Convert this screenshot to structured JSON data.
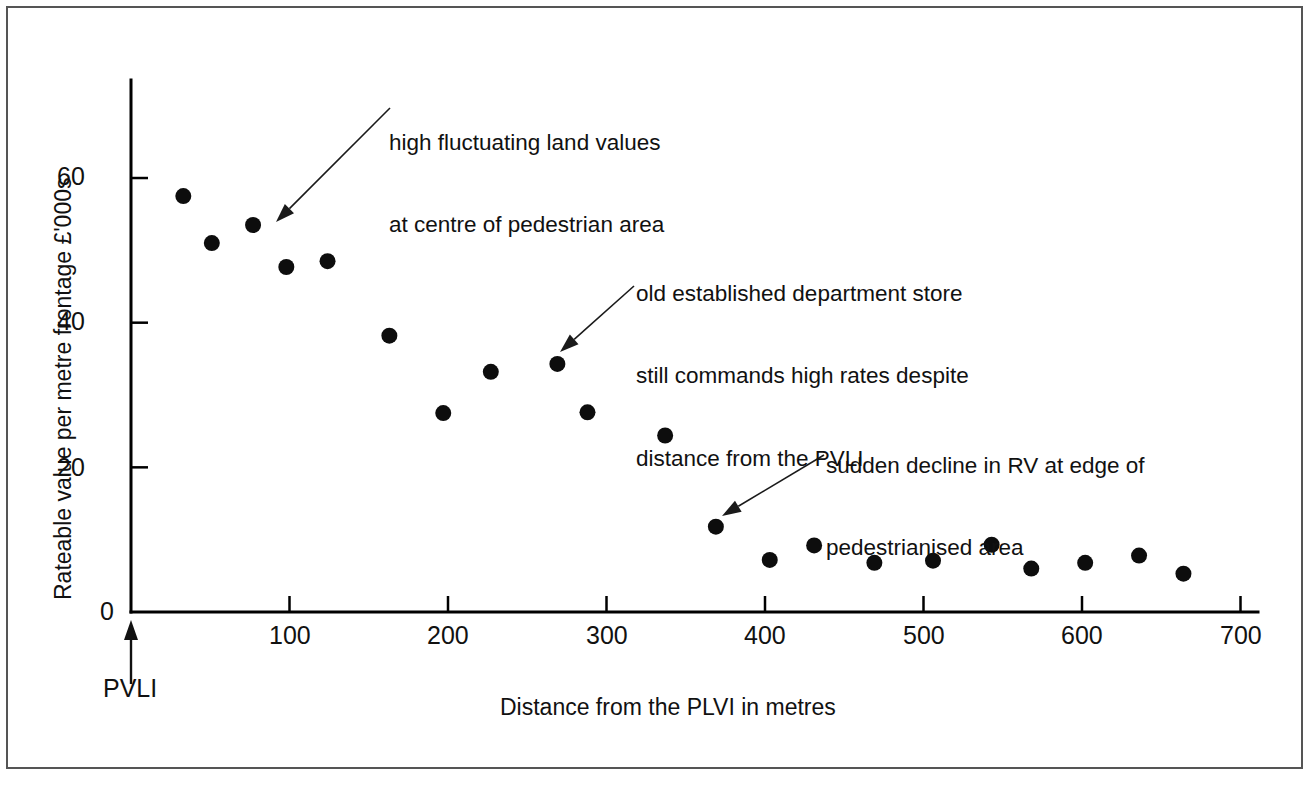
{
  "figure": {
    "background_color": "#ffffff",
    "border_color": "#555555",
    "ink_color": "#111111"
  },
  "axes": {
    "x_title": "Distance from the PLVI in metres",
    "y_title": "Rateable value per metre frontage £'000s",
    "origin_marker_label": "PVLI",
    "x_ticks": [
      "100",
      "200",
      "300",
      "400",
      "500",
      "600",
      "700"
    ],
    "y_ticks": [
      "0",
      "20",
      "40",
      "60"
    ]
  },
  "annotations": [
    {
      "name": "annotation-high-fluctuating",
      "lines": [
        "high fluctuating land values",
        "at centre of pedestrian area"
      ],
      "text_x": 389,
      "text_y": 74,
      "arrow_from_x": 390,
      "arrow_from_y": 108,
      "arrow_to_x": 276,
      "arrow_to_y": 222
    },
    {
      "name": "annotation-department-store",
      "lines": [
        "old established department store",
        "still commands high rates despite",
        "distance from the PVLI"
      ],
      "text_x": 636,
      "text_y": 225,
      "arrow_from_x": 634,
      "arrow_from_y": 286,
      "arrow_to_x": 560,
      "arrow_to_y": 352
    },
    {
      "name": "annotation-sudden-decline",
      "lines": [
        "sudden decline in RV at edge of",
        "pedestrianised area"
      ],
      "text_x": 826,
      "text_y": 397,
      "arrow_from_x": 824,
      "arrow_from_y": 455,
      "arrow_to_x": 722,
      "arrow_to_y": 516
    }
  ],
  "chart_data": {
    "type": "scatter",
    "title": "",
    "xlabel": "Distance from the PLVI in metres",
    "ylabel": "Rateable value per metre frontage £'000s",
    "xlim": [
      0,
      730
    ],
    "ylim": [
      0,
      67
    ],
    "xticks": [
      100,
      200,
      300,
      400,
      500,
      600,
      700
    ],
    "yticks": [
      0,
      20,
      40,
      60
    ],
    "grid": false,
    "legend": null,
    "marker": {
      "shape": "circle",
      "color": "#0d0d0d",
      "size": 9
    },
    "points": [
      {
        "x": 33,
        "y": 57.5
      },
      {
        "x": 51,
        "y": 51.0
      },
      {
        "x": 77,
        "y": 53.5
      },
      {
        "x": 98,
        "y": 47.7
      },
      {
        "x": 124,
        "y": 48.5
      },
      {
        "x": 163,
        "y": 38.2
      },
      {
        "x": 197,
        "y": 27.5
      },
      {
        "x": 227,
        "y": 33.2
      },
      {
        "x": 269,
        "y": 34.3
      },
      {
        "x": 288,
        "y": 27.6
      },
      {
        "x": 337,
        "y": 24.4
      },
      {
        "x": 369,
        "y": 11.8
      },
      {
        "x": 403,
        "y": 7.2
      },
      {
        "x": 431,
        "y": 9.2
      },
      {
        "x": 469,
        "y": 6.8
      },
      {
        "x": 506,
        "y": 7.1
      },
      {
        "x": 543,
        "y": 9.3
      },
      {
        "x": 568,
        "y": 6.0
      },
      {
        "x": 602,
        "y": 6.8
      },
      {
        "x": 636,
        "y": 7.8
      },
      {
        "x": 664,
        "y": 5.3
      }
    ]
  }
}
